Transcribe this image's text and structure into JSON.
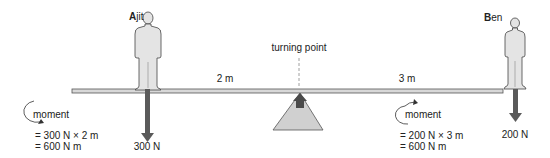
{
  "diagram": {
    "pivot": {
      "label": "turning point"
    },
    "people": [
      {
        "id": "ajit",
        "initial": "A",
        "rest": "jit",
        "force_label": "300 N",
        "distance_label": "2 m"
      },
      {
        "id": "ben",
        "initial": "B",
        "rest": "en",
        "force_label": "200 N",
        "distance_label": "3 m"
      }
    ],
    "moments": [
      {
        "side": "left",
        "direction": "anticlockwise",
        "label": "moment",
        "line1": "= 300 N × 2 m",
        "line2": "= 600 N m"
      },
      {
        "side": "right",
        "direction": "clockwise",
        "label": "moment",
        "line1": "= 200 N × 3 m",
        "line2": "= 600 N m"
      }
    ],
    "colors": {
      "beam_fill": "#d8d8d8",
      "beam_stroke": "#555555",
      "figure_fill": "#e4e4e4",
      "figure_stroke": "#444444",
      "arrow_fill": "#5a5a5a",
      "pivot_fill": "#d0d0d0"
    }
  }
}
